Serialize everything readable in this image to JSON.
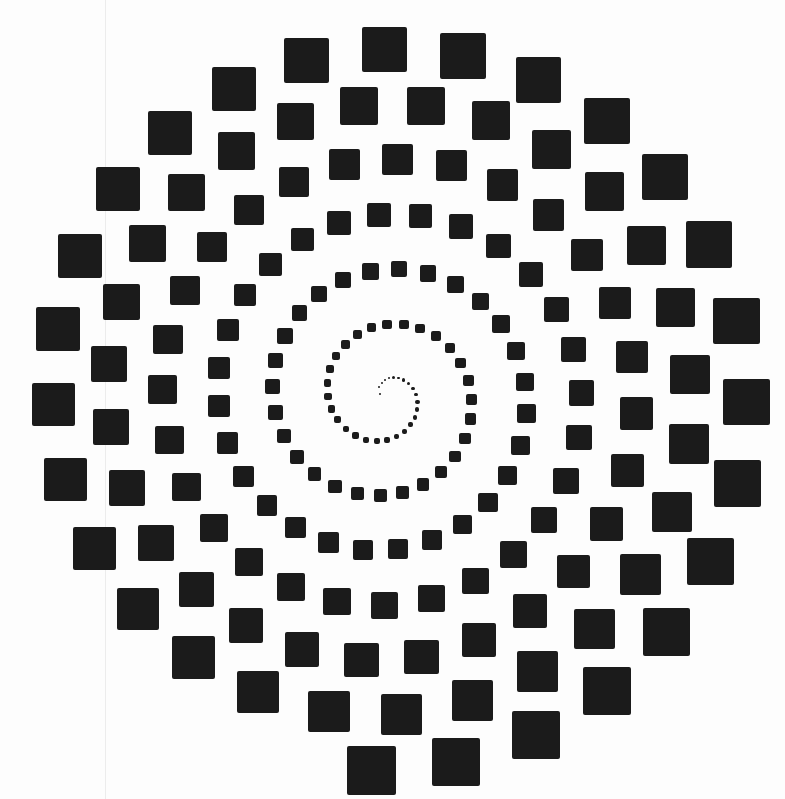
{
  "title": "Spiral of squares",
  "colors": {
    "background": "#fdfdfd",
    "square": "#1b1b1b",
    "edge_line": "#ececec"
  },
  "spiral": {
    "center": [
      386,
      396
    ],
    "start_radius": 6,
    "growth_per_turn": 55,
    "start_angle_deg": 200,
    "direction": "clockwise",
    "size_ratio": 0.13,
    "min_size": 2,
    "step_ratio": 1.75,
    "max_radius": 375,
    "bounds": {
      "width": 785,
      "height": 799
    }
  }
}
